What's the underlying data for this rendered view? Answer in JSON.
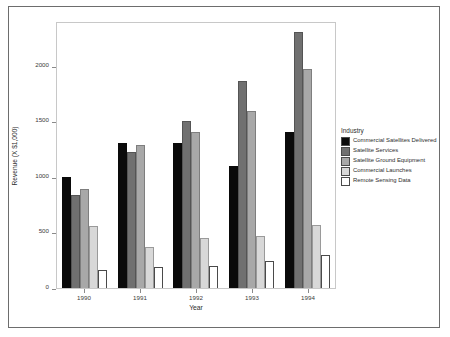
{
  "chart_data": {
    "type": "bar",
    "title": "",
    "xlabel": "Year",
    "ylabel": "Revenue (X $1,000)",
    "categories": [
      "1990",
      "1991",
      "1992",
      "1993",
      "1994"
    ],
    "ylim": [
      0,
      2400
    ],
    "yticks": [
      0,
      500,
      1000,
      1500,
      2000
    ],
    "ytick_labels": [
      "0",
      "500",
      "1000",
      "1500",
      "2000"
    ],
    "grid": false,
    "legend_title": "Industry",
    "legend_position": "right",
    "series": [
      {
        "name": "Commercial Satellites Delivered",
        "color": "#0a0a0a",
        "values": [
          1000,
          1300,
          1300,
          1100,
          1400
        ]
      },
      {
        "name": "Satellite Services",
        "color": "#707070",
        "values": [
          840,
          1220,
          1500,
          1860,
          2300
        ]
      },
      {
        "name": "Satellite Ground Equipment",
        "color": "#a8a8a8",
        "values": [
          890,
          1290,
          1400,
          1590,
          1970
        ]
      },
      {
        "name": "Commercial Launches",
        "color": "#d8d8d8",
        "values": [
          560,
          370,
          450,
          470,
          570
        ]
      },
      {
        "name": "Remote Sensing Data",
        "color": "#ffffff",
        "values": [
          160,
          190,
          200,
          240,
          300
        ]
      }
    ]
  }
}
